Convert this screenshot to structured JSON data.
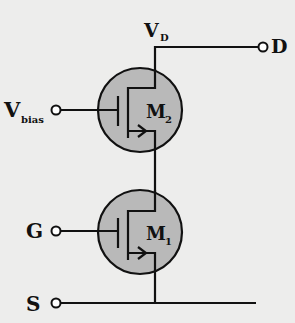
{
  "diagram": {
    "type": "cascode-nmos-circuit",
    "colors": {
      "background": "#ededec",
      "transistor_fill": "#b9b9b9",
      "line": "#111111"
    },
    "labels": {
      "vd_main": "V",
      "vd_sub": "D",
      "d_terminal": "D",
      "vbias_main": "V",
      "vbias_sub": "bias",
      "g_terminal": "G",
      "s_terminal": "S",
      "m2_main": "M",
      "m2_sub": "2",
      "m1_main": "M",
      "m1_sub": "1"
    },
    "transistors": [
      {
        "id": "M2",
        "gate": "Vbias",
        "drain": "D",
        "source": "M1 drain"
      },
      {
        "id": "M1",
        "gate": "G",
        "drain": "M2 source",
        "source": "S"
      }
    ]
  }
}
